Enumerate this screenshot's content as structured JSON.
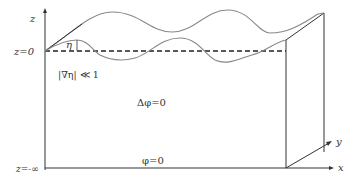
{
  "diagram": {
    "axis_labels": {
      "z": "z",
      "x": "x",
      "y": "y"
    },
    "level_labels": {
      "surface": "z=0",
      "bottom": "z=-∞"
    },
    "annotations": {
      "eta": "η",
      "slope_condition": "|∇η| ≪ 1",
      "laplace": "Δφ=0",
      "bottom_condition": "φ=0"
    },
    "colors": {
      "axis": "#333333",
      "wave": "#888888",
      "dashed": "#222222"
    }
  }
}
